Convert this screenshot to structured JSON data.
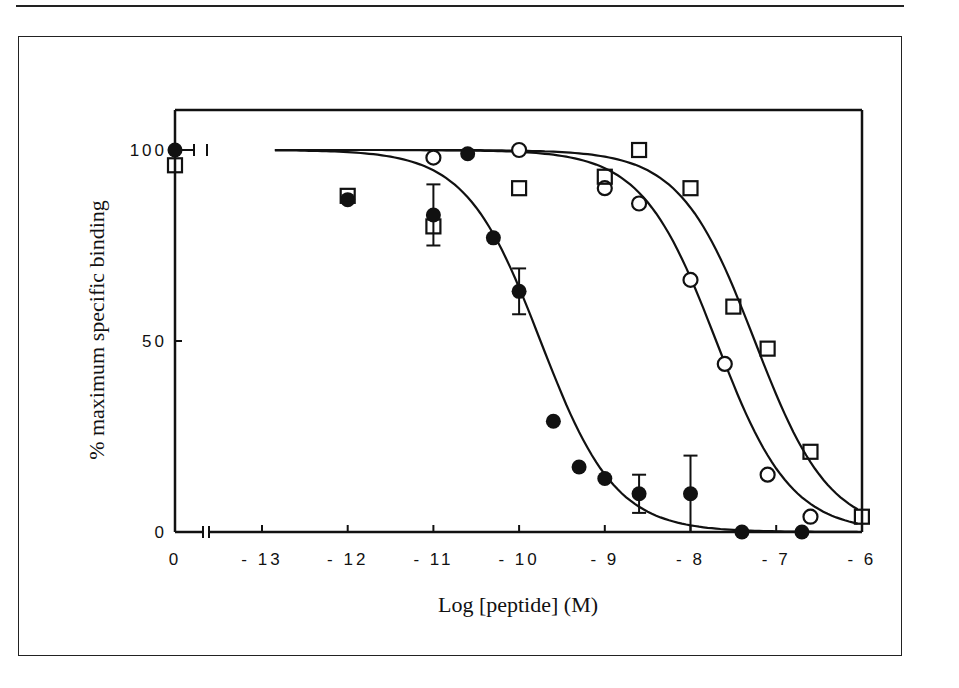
{
  "chart_data": {
    "type": "scatter",
    "title": "",
    "xlabel": "Log [peptide] (M)",
    "ylabel": "% maximum specific binding",
    "xlim": [
      -14,
      -6
    ],
    "ylim": [
      0,
      100
    ],
    "x_tick_labels": [
      "0",
      "- 13",
      "- 12",
      "- 11",
      "- 10",
      "- 9",
      "- 8",
      "- 7",
      "- 6"
    ],
    "x_ticks": [
      null,
      -13,
      -12,
      -11,
      -10,
      -9,
      -8,
      -7,
      -6
    ],
    "y_tick_labels": [
      "0",
      "50",
      "100"
    ],
    "y_ticks": [
      0,
      50,
      100
    ],
    "axis_break": true,
    "grid": false,
    "legend": null,
    "series": [
      {
        "name": "filled-circles",
        "marker": "filled-circle",
        "x": [
          "0",
          -12,
          -11,
          -10.6,
          -10.3,
          -10.0,
          -9.6,
          -9.3,
          -9.0,
          -8.6,
          -8.0,
          -7.4,
          -6.7
        ],
        "y": [
          100,
          87,
          83,
          99,
          77,
          63,
          29,
          17,
          14,
          10,
          10,
          0,
          0
        ],
        "error_bars": {
          "-11": 8,
          "-10.0": 6,
          "-8.6": 5,
          "-8.0": 10
        },
        "fit_ic50_log": -9.75
      },
      {
        "name": "open-circles",
        "marker": "open-circle",
        "x": [
          -11,
          -10,
          -9,
          -8.6,
          -8.0,
          -7.6,
          -7.1,
          -6.6
        ],
        "y": [
          98,
          100,
          90,
          86,
          66,
          44,
          15,
          4
        ],
        "fit_ic50_log": -7.7
      },
      {
        "name": "open-squares",
        "marker": "open-square",
        "x": [
          "0",
          -12,
          -11,
          -10,
          -9,
          -8.6,
          -8.0,
          -7.5,
          -7.1,
          -6.6,
          -6
        ],
        "y": [
          96,
          88,
          80,
          90,
          93,
          100,
          90,
          59,
          48,
          21,
          4
        ],
        "fit_ic50_log": -7.25
      }
    ]
  }
}
